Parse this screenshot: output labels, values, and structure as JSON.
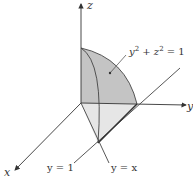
{
  "diagram": {
    "axes": {
      "x_label": "x",
      "y_label": "y",
      "z_label": "z"
    },
    "annotations": {
      "surface_label": "y² + z² = 1",
      "surface_label_base": "y",
      "surface_label_mid": " + z",
      "surface_label_end": " = 1",
      "surface_label_exp": "2",
      "line_y1_label": "y = 1",
      "line_yx_label": "y = x"
    },
    "colors": {
      "surface_fill": "#c4c4c4",
      "base_fill": "#e6e6e6",
      "stroke": "#444444"
    }
  }
}
